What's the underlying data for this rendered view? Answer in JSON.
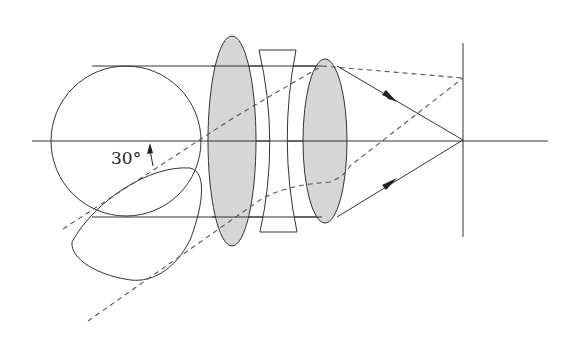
{
  "diagram": {
    "type": "optical-system",
    "labels": {
      "angle": "30°"
    },
    "colors": {
      "line": "#333333",
      "lens_fill": "#d6d6d6",
      "dashed": "#555555"
    },
    "elements": [
      {
        "name": "entrance-pupil-circle",
        "shape": "circle"
      },
      {
        "name": "off-axis-pupil-projection",
        "shape": "teardrop"
      },
      {
        "name": "convex-lens-1",
        "shape": "ellipse",
        "filled": true
      },
      {
        "name": "concave-lens",
        "shape": "biconcave"
      },
      {
        "name": "convex-lens-2",
        "shape": "ellipse",
        "filled": true
      },
      {
        "name": "focal-plane",
        "shape": "vertical-line"
      },
      {
        "name": "optical-axis",
        "shape": "horizontal-line"
      }
    ],
    "rays": {
      "axial": "solid",
      "off_axis": "dashed",
      "off_axis_angle_deg": 30
    }
  }
}
